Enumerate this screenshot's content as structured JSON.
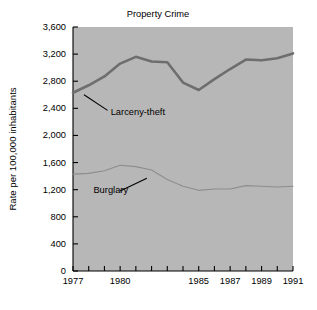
{
  "chart_data": {
    "type": "line",
    "title": "Property Crime",
    "xlabel": "",
    "ylabel": "Rate per 100,000 inhabitants",
    "x": [
      1977,
      1978,
      1979,
      1980,
      1981,
      1982,
      1983,
      1984,
      1985,
      1986,
      1987,
      1988,
      1989,
      1990,
      1991
    ],
    "xlim": [
      1977,
      1991
    ],
    "ylim": [
      0,
      3600
    ],
    "ytick_labels": [
      "0",
      "400",
      "800",
      "1,200",
      "1,600",
      "2,000",
      "2,400",
      "2,800",
      "3,200",
      "3,600"
    ],
    "ytick_values": [
      0,
      400,
      800,
      1200,
      1600,
      2000,
      2400,
      2800,
      3200,
      3600
    ],
    "xtick_values": [
      1977,
      1978,
      1979,
      1980,
      1981,
      1982,
      1983,
      1984,
      1985,
      1986,
      1987,
      1988,
      1989,
      1990,
      1991
    ],
    "xtick_labels_shown": [
      {
        "value": 1977,
        "label": "1977"
      },
      {
        "value": 1980,
        "label": "1980"
      },
      {
        "value": 1985,
        "label": "1985"
      },
      {
        "value": 1987,
        "label": "1987"
      },
      {
        "value": 1989,
        "label": "1989"
      },
      {
        "value": 1991,
        "label": "1991"
      }
    ],
    "grid": false,
    "legend_position": "inline-annotations",
    "plot_background_color": "#b7b7b7",
    "series": [
      {
        "name": "Larceny-theft",
        "color": "#6e6e6e",
        "line_width": 2.6,
        "values": [
          2630,
          2740,
          2870,
          3060,
          3160,
          3090,
          3080,
          2780,
          2670,
          2830,
          2980,
          3120,
          3110,
          3140,
          3210
        ]
      },
      {
        "name": "Burglary",
        "color": "#8d8d8d",
        "line_width": 1.1,
        "values": [
          1430,
          1440,
          1480,
          1560,
          1540,
          1490,
          1350,
          1250,
          1190,
          1210,
          1210,
          1260,
          1250,
          1240,
          1250
        ]
      }
    ],
    "annotations": [
      {
        "text": "Larceny-theft",
        "series": "Larceny-theft",
        "label_x": 1979.4,
        "label_y": 2340,
        "leader_from_x": 1977.7,
        "leader_from_y": 2600,
        "leader_to_x": 1979.2,
        "leader_to_y": 2370
      },
      {
        "text": "Burglary",
        "series": "Burglary",
        "label_x": 1978.3,
        "label_y": 1190,
        "leader_from_x": 1981.7,
        "leader_from_y": 1370,
        "leader_to_x": 1980.0,
        "leader_to_y": 1180
      }
    ]
  }
}
